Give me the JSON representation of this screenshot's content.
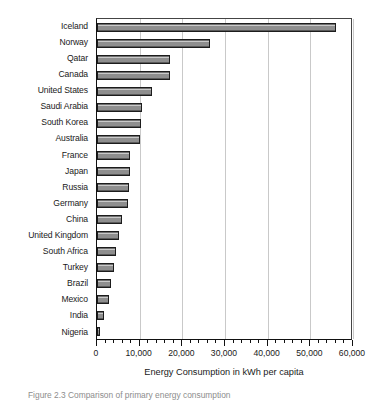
{
  "chart_data": {
    "type": "bar",
    "orientation": "horizontal",
    "title": "",
    "xlabel": "Energy Consumption in kWh per capita",
    "ylabel": "",
    "xlim": [
      0,
      60000
    ],
    "xticks": [
      0,
      10000,
      20000,
      30000,
      40000,
      50000,
      60000
    ],
    "xticklabels": [
      "0",
      "10,000",
      "20,000",
      "30,000",
      "40,000",
      "50,000",
      "60,000"
    ],
    "minor_ticks_per_interval": 5,
    "grid": "vertical",
    "legend": "none",
    "bar_color": "#8e8e8e",
    "bar_edge_color": "#1c1c1c",
    "categories": [
      "Iceland",
      "Norway",
      "Qatar",
      "Canada",
      "United States",
      "Saudi Arabia",
      "South Korea",
      "Australia",
      "France",
      "Japan",
      "Russia",
      "Germany",
      "China",
      "United Kingdom",
      "South Africa",
      "Turkey",
      "Brazil",
      "Mexico",
      "India",
      "Nigeria"
    ],
    "values": [
      56000,
      26500,
      17200,
      17000,
      13000,
      10500,
      10400,
      10000,
      7800,
      7700,
      7500,
      7200,
      5900,
      5200,
      4400,
      4000,
      3200,
      2800,
      1600,
      600
    ]
  },
  "axis_title": "Energy Consumption in kWh per capita",
  "caption": "Figure 2.3   Comparison of primary energy consumption"
}
